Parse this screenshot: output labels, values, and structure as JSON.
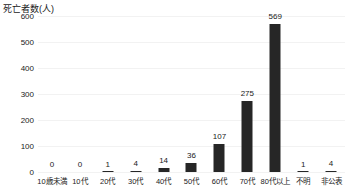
{
  "chart_data": {
    "type": "bar",
    "title": "",
    "subtitle": "",
    "xlabel": "",
    "ylabel": "死亡者数(人)",
    "categories": [
      "10歳未満",
      "10代",
      "20代",
      "30代",
      "40代",
      "50代",
      "60代",
      "70代",
      "80代以上",
      "不明",
      "非公表"
    ],
    "values": [
      0,
      0,
      1,
      4,
      14,
      36,
      107,
      275,
      569,
      1,
      4
    ],
    "value_labels": [
      "0",
      "0",
      "1",
      "4",
      "14",
      "36",
      "107",
      "275",
      "569",
      "1",
      "4"
    ],
    "ylim": [
      0,
      600
    ],
    "yticks": [
      0,
      100,
      200,
      300,
      400,
      500,
      600
    ],
    "ytick_labels": [
      "0",
      "100",
      "200",
      "300",
      "400",
      "500",
      "600"
    ],
    "grid": true,
    "legend": false,
    "legend_position": "none",
    "bar_color": "#262626",
    "grid_color": "#f2f2f2",
    "text_color": "#1a1a1a",
    "background_color": "#ffffff"
  }
}
